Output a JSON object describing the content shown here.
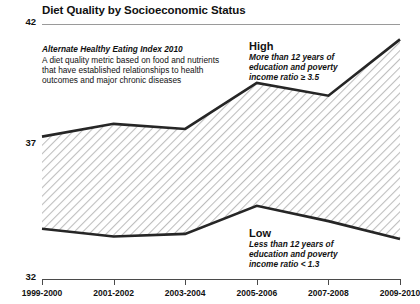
{
  "chart_data": {
    "type": "line",
    "title": "Diet Quality by Socioeconomic Status",
    "xlabel": "",
    "ylabel": "",
    "ylim": [
      32,
      42
    ],
    "yticks": [
      32,
      37,
      42
    ],
    "ytick_labels": [
      "32",
      "37",
      "42"
    ],
    "grid": "horizontal-rules-at-42-and-37",
    "legend": "inline-series-labels",
    "fill": "diagonal-hatch-between-series",
    "categories": [
      "1999-2000",
      "2001-2002",
      "2003-2004",
      "2005-2006",
      "2007-2008",
      "2009-2010"
    ],
    "series": [
      {
        "name": "High",
        "description": "More than 12 years of education and poverty income ratio ≥ 3.5",
        "values": [
          37.6,
          38.1,
          37.9,
          39.7,
          39.2,
          41.4
        ]
      },
      {
        "name": "Low",
        "description": "Less than 12 years of education and poverty income ratio < 1.3",
        "values": [
          34.0,
          33.7,
          33.8,
          34.9,
          34.3,
          33.6
        ]
      }
    ],
    "annotations": [
      {
        "head": "Alternate Healthy Eating Index 2010",
        "body": "A diet quality metric based on food and nutrients that have established relationships to health outcomes and major chronic diseases"
      }
    ]
  },
  "chart": {
    "title": "Diet Quality by Socioeconomic Status",
    "y_axis": {
      "top_label": "42",
      "mid_label": "37",
      "bottom_label": "32"
    },
    "x_axis": {
      "labels": [
        "1999-2000",
        "2001-2002",
        "2003-2004",
        "2005-2006",
        "2007-2008",
        "2009-2010"
      ]
    },
    "definition": {
      "head": "Alternate Healthy Eating Index 2010",
      "body": "A diet quality metric based on food and nutrients that have established relationships to health outcomes and major chronic diseases"
    },
    "series_high": {
      "name": "High",
      "desc": "More than 12 years of education and poverty income ratio ≥ 3.5"
    },
    "series_low": {
      "name": "Low",
      "desc": "Less than 12 years of education and poverty income ratio < 1.3"
    }
  },
  "colors": {
    "line": "#262626",
    "hatch": "#b9b9b9",
    "rule": "#9a9a9a",
    "axis": "#4a4a4a",
    "text": "#111111",
    "background": "#ffffff"
  }
}
